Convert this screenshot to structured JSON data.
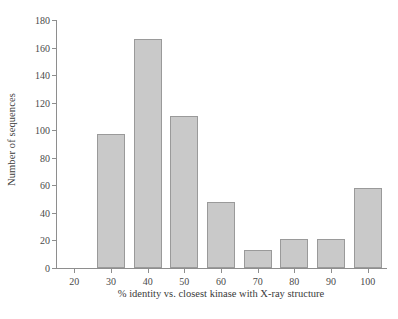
{
  "chart_data": {
    "type": "bar",
    "title": "",
    "xlabel": "% identity vs. closest kinase with X-ray structure",
    "ylabel": "Number of sequences",
    "categories": [
      "20",
      "30",
      "40",
      "50",
      "60",
      "70",
      "80",
      "90",
      "100"
    ],
    "values": [
      0,
      97,
      166,
      110,
      48,
      13,
      21,
      21,
      58
    ],
    "xtick_labels": [
      "20",
      "30",
      "40",
      "50",
      "60",
      "70",
      "80",
      "90",
      "100"
    ],
    "ytick_labels": [
      "0",
      "20",
      "40",
      "60",
      "80",
      "100",
      "120",
      "140",
      "160",
      "180"
    ],
    "ytick_values": [
      0,
      20,
      40,
      60,
      80,
      100,
      120,
      140,
      160,
      180
    ],
    "xlim": [
      15,
      105
    ],
    "ylim": [
      0,
      180
    ],
    "grid": false,
    "legend": null,
    "bar_fill": "#c9c9c9",
    "bar_border": "#9a9a9a",
    "axis_color": "#8e8e8e",
    "background": "#ffffff"
  }
}
